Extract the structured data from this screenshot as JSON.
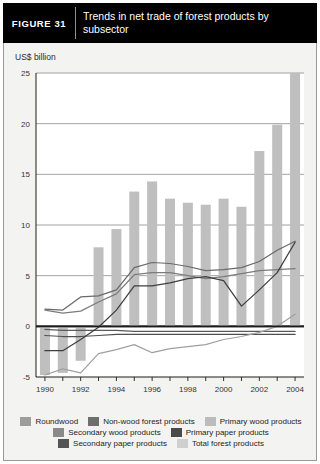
{
  "header": {
    "figure_tag": "FIGURE  31",
    "title": "Trends in net trade of forest products by subsector"
  },
  "panel": {
    "unit_label": "US$ billion"
  },
  "legend": {
    "rows": [
      [
        {
          "label": "Roundwood",
          "color": "#9d9d9d"
        },
        {
          "label": "Non-wood forest products",
          "color": "#6e6e6e"
        },
        {
          "label": "Primary wood products",
          "color": "#bcbcbc"
        }
      ],
      [
        {
          "label": "Secondary wood products",
          "color": "#8a8a8a"
        },
        {
          "label": "Primary paper products",
          "color": "#4a4a4a"
        }
      ],
      [
        {
          "label": "Secondary paper products",
          "color": "#545454"
        },
        {
          "label": "Total forest products",
          "color": "#cfcfcf"
        }
      ]
    ]
  },
  "chart_data": {
    "type": "bar",
    "title": "Trends in net trade of forest products by subsector",
    "xlabel": "",
    "ylabel": "US$ billion",
    "ylim": [
      -5,
      25
    ],
    "yticks": [
      -5,
      0,
      5,
      10,
      15,
      20,
      25
    ],
    "ytick_labels": [
      "-5",
      "0",
      "5",
      "10",
      "15",
      "20",
      "25"
    ],
    "grid": true,
    "legend_position": "bottom",
    "x": [
      1990,
      1991,
      1992,
      1993,
      1994,
      1995,
      1996,
      1997,
      1998,
      1999,
      2000,
      2001,
      2002,
      2003,
      2004
    ],
    "xtick_labels": [
      "1990",
      "",
      "1992",
      "",
      "1994",
      "",
      "1996",
      "",
      "1998",
      "",
      "2000",
      "",
      "2002",
      "",
      "2004"
    ],
    "bar_series": {
      "name": "Total forest products",
      "color": "#bfbfbf",
      "values": [
        -4.8,
        -4.6,
        -3.4,
        7.8,
        9.6,
        13.3,
        14.3,
        12.6,
        12.2,
        12.0,
        12.6,
        11.8,
        17.3,
        19.9,
        25.0
      ]
    },
    "series": [
      {
        "name": "Roundwood",
        "color": "#5a5a5a",
        "values": [
          -0.3,
          -0.4,
          -0.4,
          -0.4,
          -0.4,
          -0.5,
          -0.5,
          -0.5,
          -0.5,
          -0.5,
          -0.5,
          -0.5,
          -0.5,
          -0.5,
          -0.5
        ]
      },
      {
        "name": "Non-wood forest products",
        "color": "#4f4f4f",
        "values": [
          -0.9,
          -1.0,
          -1.0,
          -0.9,
          -0.8,
          -0.8,
          -0.8,
          -0.8,
          -0.8,
          -0.8,
          -0.8,
          -0.8,
          -0.8,
          -0.8,
          -0.8
        ]
      },
      {
        "name": "Primary wood products",
        "color": "#7c7c7c",
        "values": [
          1.6,
          1.3,
          1.5,
          2.4,
          3.2,
          5.1,
          5.3,
          5.3,
          5.0,
          4.7,
          4.9,
          5.2,
          5.5,
          5.6,
          5.7
        ]
      },
      {
        "name": "Secondary wood products",
        "color": "#6a6a6a",
        "values": [
          1.7,
          1.6,
          2.9,
          3.0,
          3.6,
          5.8,
          6.3,
          6.2,
          5.9,
          5.5,
          5.6,
          5.8,
          6.4,
          7.5,
          8.4
        ]
      },
      {
        "name": "Primary paper products",
        "color": "#3f3f3f",
        "values": [
          -2.4,
          -2.4,
          -1.3,
          -0.1,
          1.6,
          4.0,
          4.0,
          4.3,
          4.7,
          4.9,
          4.5,
          2.0,
          3.6,
          5.3,
          8.3
        ]
      },
      {
        "name": "Secondary paper products",
        "color": "#a0a0a0",
        "values": [
          -4.8,
          -4.2,
          -4.6,
          -2.7,
          -2.3,
          -1.8,
          -2.6,
          -2.2,
          -2.0,
          -1.8,
          -1.3,
          -1.0,
          -0.6,
          0.0,
          1.2
        ]
      }
    ]
  }
}
